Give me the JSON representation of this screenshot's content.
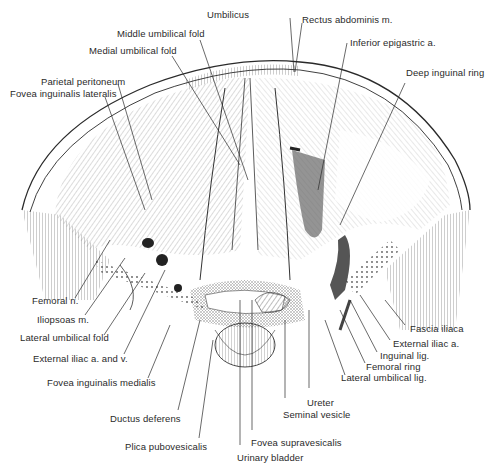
{
  "figure": {
    "style": "black-and-white line engraving",
    "colors": {
      "ink": "#2a2a2a",
      "background": "#ffffff",
      "shade": "#555555"
    }
  },
  "labels": {
    "top": [
      {
        "id": "umbilicus",
        "text": "Umbilicus"
      },
      {
        "id": "rectus-abdominis",
        "text": "Rectus abdominis m."
      },
      {
        "id": "middle-umbilical-fold",
        "text": "Middle umbilical fold"
      },
      {
        "id": "inferior-epigastric",
        "text": "Inferior epigastric a."
      },
      {
        "id": "medial-umbilical-fold",
        "text": "Medial umbilical fold"
      },
      {
        "id": "deep-inguinal-ring",
        "text": "Deep inguinal ring"
      },
      {
        "id": "parietal-peritoneum",
        "text": "Parietal peritoneum"
      },
      {
        "id": "fovea-inguinalis-lateralis",
        "text": "Fovea inguinalis lateralis"
      }
    ],
    "left": [
      {
        "id": "femoral-n",
        "text": "Femoral n."
      },
      {
        "id": "iliopsoas",
        "text": "Iliopsoas m."
      },
      {
        "id": "lateral-umbilical-fold",
        "text": "Lateral umbilical fold"
      },
      {
        "id": "external-iliac-av",
        "text": "External iliac a. and v."
      },
      {
        "id": "fovea-inguinalis-medialis",
        "text": "Fovea inguinalis medialis"
      },
      {
        "id": "ductus-deferens",
        "text": "Ductus deferens"
      },
      {
        "id": "plica-pubovesicalis",
        "text": "Plica pubovesicalis"
      }
    ],
    "bottom": [
      {
        "id": "fovea-supravesicalis",
        "text": "Fovea supravesicalis"
      },
      {
        "id": "urinary-bladder",
        "text": "Urinary bladder"
      },
      {
        "id": "ureter",
        "text": "Ureter"
      },
      {
        "id": "seminal-vesicle",
        "text": "Seminal vesicle"
      }
    ],
    "right": [
      {
        "id": "fascia-iliaca",
        "text": "Fascia iliaca"
      },
      {
        "id": "external-iliac-a",
        "text": "External iliac a."
      },
      {
        "id": "inguinal-lig",
        "text": "Inguinal lig."
      },
      {
        "id": "femoral-ring",
        "text": "Femoral ring"
      },
      {
        "id": "lateral-umbilical-lig",
        "text": "Lateral umbilical lig."
      }
    ]
  }
}
